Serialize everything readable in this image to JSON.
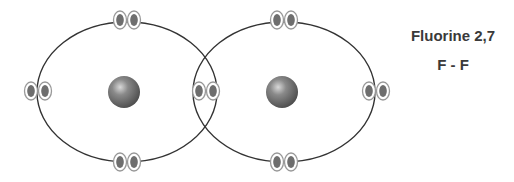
{
  "title": "Fluorine 2,7",
  "formula": "F - F",
  "colors": {
    "shell": "#333333",
    "electron_fill": "#6e6e6e",
    "electron_ring": "#999999",
    "nucleus": "#7a7a7a",
    "text": "#3a3a3a"
  },
  "atoms": [
    {
      "element": "F",
      "nucleus": {
        "cx": 124,
        "cy": 92,
        "r": 16
      },
      "shell": {
        "cx": 127,
        "cy": 92,
        "rx": 90,
        "ry": 70
      },
      "lone_pairs": [
        {
          "position": "top",
          "cx": 127,
          "cy": 20
        },
        {
          "position": "left",
          "cx": 38,
          "cy": 91
        },
        {
          "position": "bottom",
          "cx": 127,
          "cy": 162
        }
      ]
    },
    {
      "element": "F",
      "nucleus": {
        "cx": 282,
        "cy": 92,
        "r": 16
      },
      "shell": {
        "cx": 284,
        "cy": 92,
        "rx": 91,
        "ry": 70
      },
      "lone_pairs": [
        {
          "position": "top",
          "cx": 284,
          "cy": 20
        },
        {
          "position": "right",
          "cx": 376,
          "cy": 91
        },
        {
          "position": "bottom",
          "cx": 284,
          "cy": 162
        }
      ]
    }
  ],
  "shared_pair": {
    "cx": 206,
    "cy": 91
  }
}
